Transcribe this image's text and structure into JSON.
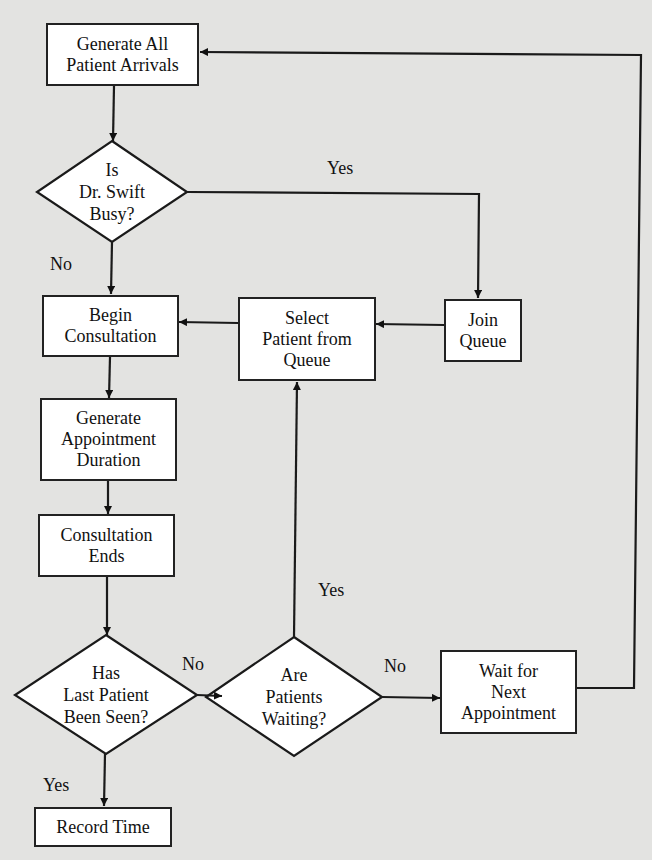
{
  "diagram": {
    "type": "flowchart",
    "nodes": {
      "generate_arrivals": {
        "shape": "process",
        "lines": [
          "Generate All",
          "Patient Arrivals"
        ]
      },
      "is_busy": {
        "shape": "decision",
        "lines": [
          "Is",
          "Dr. Swift",
          "Busy?"
        ]
      },
      "begin_consultation": {
        "shape": "process",
        "lines": [
          "Begin",
          "Consultation"
        ]
      },
      "select_patient": {
        "shape": "process",
        "lines": [
          "Select",
          "Patient from",
          "Queue"
        ]
      },
      "join_queue": {
        "shape": "process",
        "lines": [
          "Join",
          "Queue"
        ]
      },
      "generate_duration": {
        "shape": "process",
        "lines": [
          "Generate",
          "Appointment",
          "Duration"
        ]
      },
      "consultation_ends": {
        "shape": "process",
        "lines": [
          "Consultation",
          "Ends"
        ]
      },
      "last_patient_seen": {
        "shape": "decision",
        "lines": [
          "Has",
          "Last Patient",
          "Been Seen?"
        ]
      },
      "patients_waiting": {
        "shape": "decision",
        "lines": [
          "Are",
          "Patients",
          "Waiting?"
        ]
      },
      "wait_next": {
        "shape": "process",
        "lines": [
          "Wait for",
          "Next",
          "Appointment"
        ]
      },
      "record_time": {
        "shape": "process",
        "lines": [
          "Record Time"
        ]
      }
    },
    "edge_labels": {
      "busy_yes": "Yes",
      "busy_no": "No",
      "last_no": "No",
      "last_yes": "Yes",
      "waiting_yes": "Yes",
      "waiting_no": "No"
    },
    "edges": [
      {
        "from": "generate_arrivals",
        "to": "is_busy",
        "label": ""
      },
      {
        "from": "is_busy",
        "to": "join_queue",
        "label": "Yes"
      },
      {
        "from": "is_busy",
        "to": "begin_consultation",
        "label": "No"
      },
      {
        "from": "join_queue",
        "to": "select_patient",
        "label": ""
      },
      {
        "from": "select_patient",
        "to": "begin_consultation",
        "label": ""
      },
      {
        "from": "begin_consultation",
        "to": "generate_duration",
        "label": ""
      },
      {
        "from": "generate_duration",
        "to": "consultation_ends",
        "label": ""
      },
      {
        "from": "consultation_ends",
        "to": "last_patient_seen",
        "label": ""
      },
      {
        "from": "last_patient_seen",
        "to": "patients_waiting",
        "label": "No"
      },
      {
        "from": "last_patient_seen",
        "to": "record_time",
        "label": "Yes"
      },
      {
        "from": "patients_waiting",
        "to": "select_patient",
        "label": "Yes"
      },
      {
        "from": "patients_waiting",
        "to": "wait_next",
        "label": "No"
      },
      {
        "from": "wait_next",
        "to": "generate_arrivals",
        "label": ""
      }
    ],
    "colors": {
      "background": "#e3e3e1",
      "node_fill": "#ffffff",
      "stroke": "#222222"
    }
  }
}
